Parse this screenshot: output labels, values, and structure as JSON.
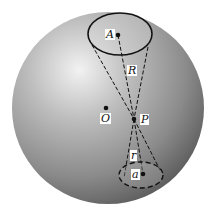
{
  "diagram": {
    "colors": {
      "background": "#ffffff",
      "sphere_light": "#ececec",
      "sphere_dark": "#5a5a5a",
      "ink": "#111111"
    },
    "labels": {
      "A": "A",
      "R": "R",
      "O": "O",
      "P": "P",
      "r": "r",
      "a": "a"
    }
  }
}
